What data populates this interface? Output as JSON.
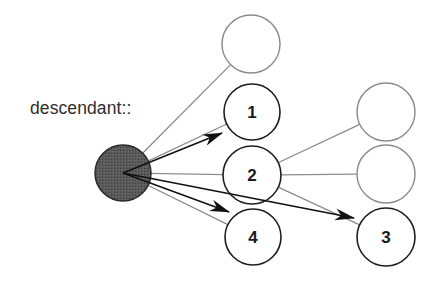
{
  "diagram": {
    "axis_label": "descendant::",
    "context_node": {
      "id": "context",
      "cx": 123,
      "cy": 173,
      "r": 28,
      "fill": "#555555",
      "stroke": "#2a2a2a"
    },
    "nodes": [
      {
        "id": "n-top",
        "label": "",
        "cx": 251,
        "cy": 44,
        "r": 29,
        "selected": false
      },
      {
        "id": "n1",
        "label": "1",
        "cx": 252,
        "cy": 112,
        "r": 28,
        "selected": true
      },
      {
        "id": "n2",
        "label": "2",
        "cx": 252,
        "cy": 175,
        "r": 29,
        "selected": true
      },
      {
        "id": "n4",
        "label": "4",
        "cx": 253,
        "cy": 237,
        "r": 28,
        "selected": true
      },
      {
        "id": "n-righttop",
        "label": "",
        "cx": 386,
        "cy": 112,
        "r": 29,
        "selected": false
      },
      {
        "id": "n-rightmid",
        "label": "",
        "cx": 386,
        "cy": 174,
        "r": 29,
        "selected": false
      },
      {
        "id": "n3",
        "label": "3",
        "cx": 386,
        "cy": 237,
        "r": 29,
        "selected": true
      }
    ],
    "tree_edges": [
      {
        "from": "context",
        "to": "n-top"
      },
      {
        "from": "context",
        "to": "n1"
      },
      {
        "from": "context",
        "to": "n2"
      },
      {
        "from": "context",
        "to": "n4"
      },
      {
        "from": "n2",
        "to": "n-righttop"
      },
      {
        "from": "n2",
        "to": "n-rightmid"
      },
      {
        "from": "n2",
        "to": "n3"
      }
    ],
    "axis_arrows": [
      {
        "to": "n1",
        "tip": [
          222,
          133
        ]
      },
      {
        "to": "n4",
        "tip": [
          229,
          212
        ]
      },
      {
        "to": "n3",
        "tip": [
          354,
          218
        ]
      }
    ],
    "colors": {
      "selected_stroke": "#1e1e1e",
      "unselected_stroke": "#8a8a8a",
      "tree_edge": "#8c8c8c",
      "arrow": "#111111"
    }
  }
}
